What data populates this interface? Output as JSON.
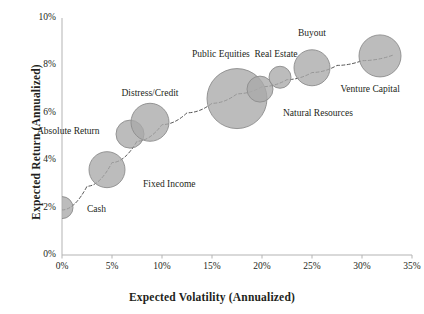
{
  "chart_data": {
    "type": "scatter",
    "title": "",
    "subtitle": "",
    "xlabel": "Expected Volatility (Annualized)",
    "ylabel": "Expected Return (Annualized)",
    "xlim": [
      0,
      35
    ],
    "ylim": [
      0,
      10
    ],
    "xticks": [
      "0%",
      "5%",
      "10%",
      "15%",
      "20%",
      "25%",
      "30%",
      "35%"
    ],
    "xtick_values": [
      0,
      5,
      10,
      15,
      20,
      25,
      30,
      35
    ],
    "yticks": [
      "0%",
      "2%",
      "4%",
      "6%",
      "8%",
      "10%"
    ],
    "ytick_values": [
      0,
      2,
      4,
      6,
      8,
      10
    ],
    "grid": false,
    "legend": "none",
    "bubble_fill": "#a9a9a9",
    "bubble_stroke": "#8c8c8c",
    "trendline_color": "#555555",
    "trendline_style": "dashed",
    "axis_color": "#b3b3b3",
    "points": [
      {
        "label": "Cash",
        "x": 0.0,
        "y": 2.0,
        "size": 11,
        "label_dx": 14,
        "label_dy": 2,
        "anchor": "start"
      },
      {
        "label": "Fixed Income",
        "x": 4.5,
        "y": 3.6,
        "size": 18,
        "label_dx": 18,
        "label_dy": 15,
        "anchor": "start"
      },
      {
        "label": "Absolute Return",
        "x": 6.8,
        "y": 5.1,
        "size": 14,
        "label_dx": -16,
        "label_dy": -2,
        "anchor": "end"
      },
      {
        "label": "Distress/Credit",
        "x": 8.8,
        "y": 5.6,
        "size": 19,
        "label_dx": 0,
        "label_dy": -28,
        "anchor": "middle"
      },
      {
        "label": "Public Equities",
        "x": 17.5,
        "y": 6.6,
        "size": 30,
        "label_dx": -16,
        "label_dy": -44,
        "anchor": "middle"
      },
      {
        "label": "Natural Resources",
        "x": 19.8,
        "y": 7.0,
        "size": 13,
        "label_dx": 10,
        "label_dy": 25,
        "anchor": "start"
      },
      {
        "label": "Real Estate",
        "x": 21.8,
        "y": 7.5,
        "size": 11,
        "label_dx": -4,
        "label_dy": -22,
        "anchor": "middle"
      },
      {
        "label": "Buyout",
        "x": 25.0,
        "y": 7.9,
        "size": 18,
        "label_dx": 0,
        "label_dy": -34,
        "anchor": "middle"
      },
      {
        "label": "Venture Capital",
        "x": 31.8,
        "y": 8.4,
        "size": 21,
        "label_dx": -10,
        "label_dy": 34,
        "anchor": "middle"
      }
    ],
    "trendline": [
      {
        "x": 0.0,
        "y": 1.9
      },
      {
        "x": 2.5,
        "y": 2.9
      },
      {
        "x": 5.0,
        "y": 3.9
      },
      {
        "x": 7.5,
        "y": 4.8
      },
      {
        "x": 10.0,
        "y": 5.5
      },
      {
        "x": 12.5,
        "y": 6.0
      },
      {
        "x": 15.0,
        "y": 6.4
      },
      {
        "x": 17.5,
        "y": 6.8
      },
      {
        "x": 20.0,
        "y": 7.1
      },
      {
        "x": 22.5,
        "y": 7.4
      },
      {
        "x": 25.0,
        "y": 7.7
      },
      {
        "x": 27.5,
        "y": 8.0
      },
      {
        "x": 30.0,
        "y": 8.2
      },
      {
        "x": 33.2,
        "y": 8.45
      }
    ]
  }
}
